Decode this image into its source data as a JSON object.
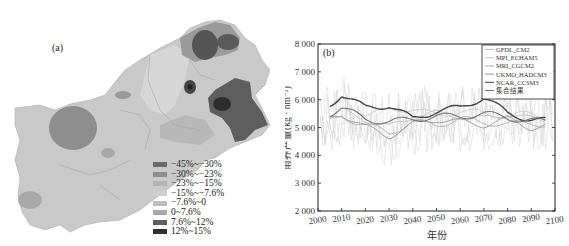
{
  "map": {
    "label": "(a)",
    "legend": [
      {
        "label": "−45%~−30%",
        "color": "#6a6a6a"
      },
      {
        "label": "−30%~−23%",
        "color": "#8e8e8e"
      },
      {
        "label": "−23%~−15%",
        "color": "#b4b4b4"
      },
      {
        "label": "−15%~−7.6%",
        "color": "#cfcfcf"
      },
      {
        "label": "−7.6%~0",
        "color": "#bdbdbd"
      },
      {
        "label": "0~7.6%",
        "color": "#a8a8a8"
      },
      {
        "label": "7.6%~12%",
        "color": "#5e5e5e"
      },
      {
        "label": "12%~15%",
        "color": "#2e2e2e"
      }
    ]
  },
  "chart_data": {
    "type": "line",
    "panel_label": "(b)",
    "title": "",
    "xlabel": "年份",
    "ylabel": "雨养产量(kg · hm⁻²)",
    "xlim": [
      2000,
      2100
    ],
    "ylim": [
      2000,
      8000
    ],
    "xticks": [
      2000,
      2010,
      2020,
      2030,
      2040,
      2050,
      2060,
      2070,
      2080,
      2090,
      2100
    ],
    "yticks": [
      2000,
      3000,
      4000,
      5000,
      6000,
      7000,
      8000
    ],
    "ytick_labels": [
      "2 000",
      "3 000",
      "4 000",
      "5 000",
      "6 000",
      "7 000",
      "8 000"
    ],
    "legend_position": "upper right",
    "grid": false,
    "series": [
      {
        "name": "GFDL_CM2",
        "color": "#bbbbbb",
        "x": [
          2000,
          2010,
          2020,
          2030,
          2040,
          2050,
          2060,
          2070,
          2080,
          2090,
          2100
        ],
        "values": [
          5200,
          5600,
          5300,
          5000,
          5400,
          5500,
          5400,
          5300,
          5500,
          5300,
          5200
        ]
      },
      {
        "name": "MPI_ECHAM5",
        "color": "#c8c8c8",
        "x": [
          2000,
          2010,
          2020,
          2030,
          2040,
          2050,
          2060,
          2070,
          2080,
          2090,
          2100
        ],
        "values": [
          5300,
          6000,
          5500,
          5600,
          5700,
          5400,
          5600,
          5500,
          5400,
          5500,
          5300
        ]
      },
      {
        "name": "MRI_CGCM2",
        "color": "#aaaaaa",
        "x": [
          2000,
          2010,
          2020,
          2030,
          2040,
          2050,
          2060,
          2070,
          2080,
          2090,
          2100
        ],
        "values": [
          5000,
          5400,
          5100,
          4800,
          5200,
          5100,
          5300,
          5200,
          5100,
          5200,
          5000
        ]
      },
      {
        "name": "UKMO_HADCM3",
        "color": "#999999",
        "x": [
          2000,
          2010,
          2020,
          2030,
          2040,
          2050,
          2060,
          2070,
          2080,
          2090,
          2100
        ],
        "values": [
          5200,
          5500,
          5000,
          4700,
          5100,
          5300,
          5200,
          5100,
          5300,
          5000,
          5100
        ]
      },
      {
        "name": "NCAR_CCSM3",
        "color": "#444444",
        "x": [
          2000,
          2010,
          2020,
          2030,
          2040,
          2050,
          2060,
          2070,
          2080,
          2090,
          2100
        ],
        "values": [
          5400,
          6200,
          5700,
          5800,
          5300,
          5600,
          5700,
          6100,
          5500,
          5300,
          5200
        ]
      },
      {
        "name": "集合结果",
        "color": "#777777",
        "x": [
          2000,
          2010,
          2020,
          2030,
          2040,
          2050,
          2060,
          2070,
          2080,
          2090,
          2100
        ],
        "values": [
          5300,
          5700,
          5300,
          5200,
          5300,
          5400,
          5400,
          5500,
          5350,
          5250,
          5150
        ]
      }
    ]
  }
}
